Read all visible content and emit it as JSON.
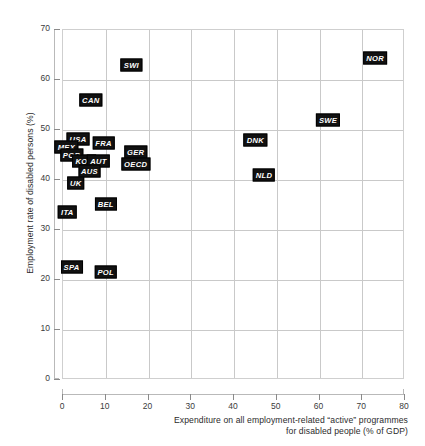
{
  "chart_data": {
    "type": "scatter",
    "title": "",
    "xlabel": "Expenditure on all employment-related “active” programmes for disabled people (% of GDP)",
    "xlabel_line1": "Expenditure on all employment-related “active” programmes",
    "xlabel_line2": "for disabled people (% of GDP)",
    "ylabel": "Employment rate of disabled persons (%)",
    "xlim": [
      0,
      80
    ],
    "ylim": [
      0,
      70
    ],
    "xticks": [
      0,
      10,
      20,
      30,
      40,
      50,
      60,
      70,
      80
    ],
    "yticks": [
      0,
      10,
      20,
      30,
      40,
      50,
      60,
      70
    ],
    "xtick_labels": [
      "0",
      "10",
      "20",
      "30",
      "40",
      "50",
      "60",
      "70",
      "80"
    ],
    "ytick_labels": [
      "0",
      "10",
      "20",
      "30",
      "40",
      "50",
      "60",
      "70"
    ],
    "grid": true,
    "grid_color": "#c9c9c9",
    "legend": "none",
    "marker_style": "text-label-box",
    "marker_color": "#111111",
    "marker_text_color": "#ffffff",
    "points": [
      {
        "label": "SWI",
        "x": 16.0,
        "y": 63.0
      },
      {
        "label": "NOR",
        "x": 73.0,
        "y": 64.5
      },
      {
        "label": "CAN",
        "x": 6.5,
        "y": 56.0
      },
      {
        "label": "SWE",
        "x": 62.0,
        "y": 52.0
      },
      {
        "label": "USA",
        "x": 3.5,
        "y": 48.3
      },
      {
        "label": "DNK",
        "x": 45.0,
        "y": 48.0
      },
      {
        "label": "FRA",
        "x": 9.5,
        "y": 47.4
      },
      {
        "label": "MEX",
        "x": 0.8,
        "y": 46.6
      },
      {
        "label": "GER",
        "x": 17.0,
        "y": 45.6
      },
      {
        "label": "POR",
        "x": 2.0,
        "y": 45.0
      },
      {
        "label": "KOR",
        "x": 5.0,
        "y": 43.8
      },
      {
        "label": "AUT",
        "x": 8.3,
        "y": 43.8
      },
      {
        "label": "OECD",
        "x": 17.0,
        "y": 43.2
      },
      {
        "label": "AUS",
        "x": 6.2,
        "y": 41.9
      },
      {
        "label": "NLD",
        "x": 47.0,
        "y": 41.0
      },
      {
        "label": "UK",
        "x": 3.0,
        "y": 39.4
      },
      {
        "label": "BEL",
        "x": 10.0,
        "y": 35.2
      },
      {
        "label": "ITA",
        "x": 1.0,
        "y": 33.7
      },
      {
        "label": "SPA",
        "x": 2.0,
        "y": 22.6
      },
      {
        "label": "POL",
        "x": 10.0,
        "y": 21.7
      }
    ]
  }
}
